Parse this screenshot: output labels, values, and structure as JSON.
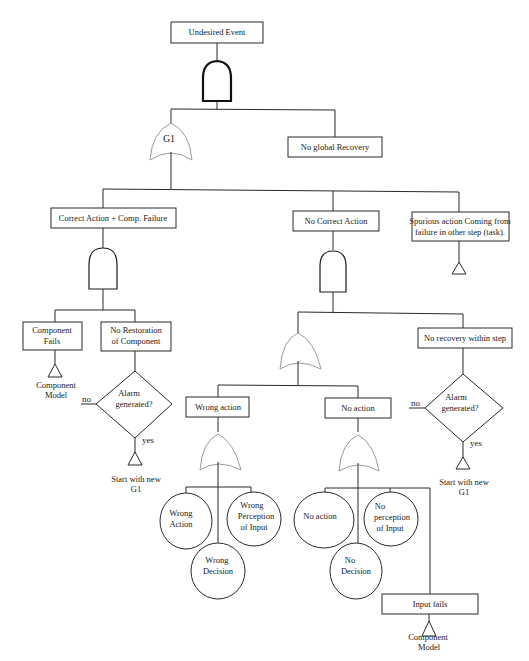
{
  "diagram": {
    "type": "fault-tree",
    "top_event": "Undesired Event",
    "nodes": {
      "g1_gate": "G1",
      "no_global_recovery": "No global Recovery",
      "correct_action_comp_failure": "Correct Action  + Comp. Failure",
      "no_correct_action": "No Correct Action",
      "spurious_action": [
        "Spurious action Coming from",
        "failure in other step (task)."
      ],
      "component_fails": [
        "Component",
        "Fails"
      ],
      "no_restoration": [
        "No Restoration",
        "of Component"
      ],
      "component_model_left": [
        "Component",
        "Model"
      ],
      "alarm_left": [
        "Alarm",
        "generated?"
      ],
      "alarm_left_no": "no",
      "alarm_left_yes": "yes",
      "start_new_left": [
        "Start with new",
        "G1"
      ],
      "no_recovery_within_step": "No recovery within step",
      "alarm_right": [
        "Alarm",
        "generated?"
      ],
      "alarm_right_no": "no",
      "alarm_right_yes": "yes",
      "start_new_right": [
        "Start with new",
        "G1"
      ],
      "wrong_action_box": "Wrong action",
      "no_action_box": "No action",
      "wrong_action_circle": [
        "Wrong",
        "Action"
      ],
      "wrong_perception_circle": [
        "Wrong",
        "Perception",
        "of Input"
      ],
      "wrong_decision_circle": [
        "Wrong",
        "Decision"
      ],
      "no_action_circle": "No action",
      "no_perception_circle": [
        "No",
        "perception",
        "of Input"
      ],
      "no_decision_circle": [
        "No",
        "Decision"
      ],
      "input_fails": "Input fails",
      "component_model_bottom": [
        "Component",
        "Model"
      ]
    },
    "colors": {
      "line": "#2a2a2a",
      "or_gate_outline": "#9a9a9a",
      "background": "#ffffff"
    }
  }
}
